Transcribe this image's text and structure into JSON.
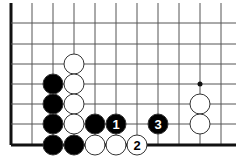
{
  "diagram": {
    "type": "go-board-fragment",
    "grid": {
      "x_lines": [
        11,
        32,
        53,
        74,
        95,
        116,
        137,
        158,
        179,
        200,
        221
      ],
      "y_lines": [
        23,
        44,
        64,
        84,
        104,
        124,
        145
      ],
      "x_end": 236,
      "y_top": 3,
      "left_edge_x": 11,
      "bottom_edge_y": 145,
      "line_color": "#555555",
      "edge_color": "#111111"
    },
    "star_points": [
      {
        "col": 9,
        "row": 3
      }
    ],
    "stones": [
      {
        "color": "white",
        "col": 3,
        "row": 2,
        "label": ""
      },
      {
        "color": "black",
        "col": 2,
        "row": 3,
        "label": ""
      },
      {
        "color": "white",
        "col": 3,
        "row": 3,
        "label": ""
      },
      {
        "color": "black",
        "col": 2,
        "row": 4,
        "label": ""
      },
      {
        "color": "white",
        "col": 3,
        "row": 4,
        "label": ""
      },
      {
        "color": "black",
        "col": 2,
        "row": 5,
        "label": ""
      },
      {
        "color": "white",
        "col": 3,
        "row": 5,
        "label": ""
      },
      {
        "color": "black",
        "col": 4,
        "row": 5,
        "label": ""
      },
      {
        "color": "black",
        "col": 5,
        "row": 5,
        "label": "1"
      },
      {
        "color": "black",
        "col": 7,
        "row": 5,
        "label": "3"
      },
      {
        "color": "black",
        "col": 2,
        "row": 6,
        "label": ""
      },
      {
        "color": "black",
        "col": 3,
        "row": 6,
        "label": ""
      },
      {
        "color": "white",
        "col": 4,
        "row": 6,
        "label": ""
      },
      {
        "color": "white",
        "col": 5,
        "row": 6,
        "label": ""
      },
      {
        "color": "white",
        "col": 6,
        "row": 6,
        "label": "2"
      },
      {
        "color": "white",
        "col": 9,
        "row": 4,
        "label": ""
      },
      {
        "color": "white",
        "col": 9,
        "row": 5,
        "label": ""
      }
    ],
    "colors": {
      "black": "#000000",
      "white": "#ffffff",
      "stone_outline": "#333333"
    }
  }
}
